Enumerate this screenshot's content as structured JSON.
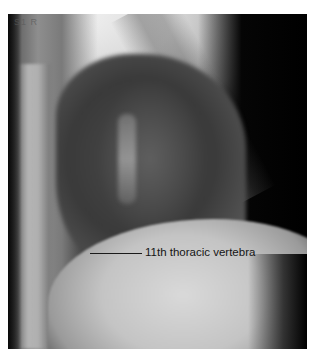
{
  "image": {
    "type": "lateral chest radiograph",
    "film_marker": "S1 R"
  },
  "annotations": [
    {
      "label": "11th thoracic vertebra",
      "leader_line": true
    }
  ]
}
